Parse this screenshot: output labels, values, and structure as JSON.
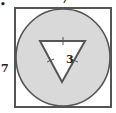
{
  "figure": {
    "type": "geometry-diagram",
    "colors": {
      "stroke": "#555555",
      "circle_fill": "#d9d9d9",
      "square_fill": "#ffffff",
      "triangle_fill": "#ffffff"
    },
    "labels": {
      "square_top_side": "7",
      "square_left_side": "7",
      "triangle_side": "3",
      "bullet": "•"
    },
    "shapes": {
      "square": {
        "side": 7
      },
      "circle": {
        "inscribed_in": "square"
      },
      "triangle": {
        "type": "equilateral",
        "side": 3,
        "orientation": "point-down",
        "tick_marks": 3
      }
    }
  }
}
